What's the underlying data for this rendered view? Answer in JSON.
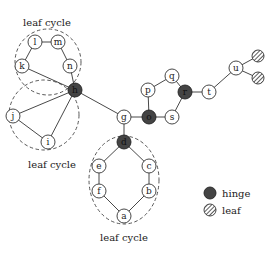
{
  "diagram": {
    "nodes": {
      "a": "a",
      "b": "b",
      "c": "c",
      "d": "d",
      "e": "e",
      "f": "f",
      "g": "g",
      "h": "h",
      "i": "i",
      "j": "j",
      "k": "k",
      "l": "l",
      "m": "m",
      "n": "n",
      "o": "o",
      "p": "p",
      "q": "q",
      "r": "r",
      "s": "s",
      "t": "t",
      "u": "u"
    },
    "hinges": [
      "h",
      "d",
      "o",
      "r"
    ],
    "leaves": [
      "leaf-1",
      "leaf-2"
    ],
    "captions": {
      "top": "leaf cycle",
      "left": "leaf cycle",
      "bottom": "leaf cycle"
    },
    "legend": {
      "hinge": "hinge",
      "leaf": "leaf"
    },
    "colors": {
      "hinge_fill": "#444444",
      "node_fill": "#ffffff",
      "stroke": "#333333"
    }
  }
}
